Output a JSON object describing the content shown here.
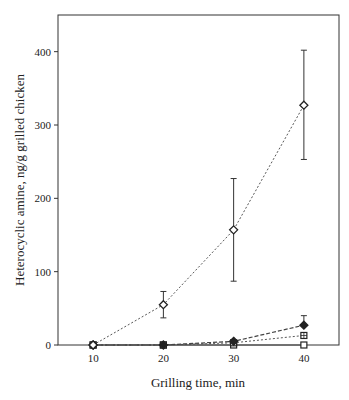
{
  "chart_data": {
    "type": "line",
    "title": "",
    "xlabel": "Grilling time, min",
    "ylabel": "Heterocyclic amine, ng/g grilled chicken",
    "x": [
      10,
      20,
      30,
      40
    ],
    "xticks": [
      "10",
      "20",
      "30",
      "40"
    ],
    "yticks": [
      "0",
      "100",
      "200",
      "300",
      "400"
    ],
    "xlim": [
      5,
      45
    ],
    "ylim": [
      0,
      450
    ],
    "grid": false,
    "legend": "none",
    "series": [
      {
        "name": "open diamond",
        "marker": "diamond-open",
        "line": "dotted",
        "values": [
          0,
          55,
          157,
          327
        ],
        "error_low": [
          0,
          37,
          87,
          253
        ],
        "error_high": [
          0,
          73,
          227,
          402
        ]
      },
      {
        "name": "filled diamond",
        "marker": "diamond-filled",
        "line": "dashed",
        "values": [
          0,
          0,
          5,
          27
        ],
        "error_low": [
          0,
          0,
          5,
          27
        ],
        "error_high": [
          0,
          0,
          5,
          40
        ]
      },
      {
        "name": "crossed square",
        "marker": "square-crossed",
        "line": "dotted",
        "values": [
          0,
          0,
          3,
          13
        ]
      },
      {
        "name": "open square",
        "marker": "square-open",
        "line": "solid",
        "values": [
          0,
          0,
          0,
          0
        ]
      }
    ]
  }
}
